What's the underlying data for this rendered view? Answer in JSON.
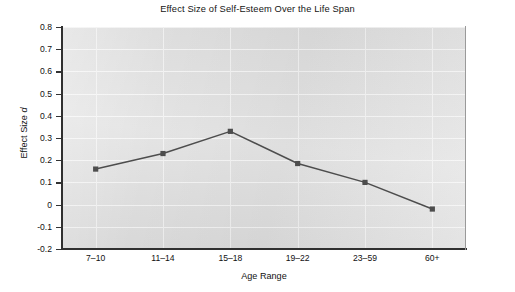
{
  "chart_data": {
    "type": "line",
    "title": "Effect Size of Self-Esteem Over the Life Span",
    "xlabel": "Age Range",
    "ylabel": "Effect Size d",
    "ylabel_plain": "Effect Size ",
    "ylabel_italic": "d",
    "categories": [
      "7–10",
      "11–14",
      "15–18",
      "19–22",
      "23–59",
      "60+"
    ],
    "values": [
      0.16,
      0.23,
      0.33,
      0.185,
      0.1,
      -0.02
    ],
    "series": [
      {
        "name": "Effect Size d",
        "values": [
          0.16,
          0.23,
          0.33,
          0.185,
          0.1,
          -0.02
        ]
      }
    ],
    "ylim": [
      -0.2,
      0.8
    ],
    "ytick_step": 0.1,
    "yticks": [
      0.8,
      0.7,
      0.6,
      0.5,
      0.4,
      0.3,
      0.2,
      0.1,
      0,
      -0.1,
      -0.2
    ],
    "ytick_labels": [
      "0.8",
      "0.7",
      "0.6",
      "0.5",
      "0.4",
      "0.3",
      "0.2",
      "0.1",
      "0",
      "-0.1",
      "-0.2"
    ],
    "grid": "both",
    "gridline_color": "#f4f4f4",
    "legend": "none",
    "marker": "square",
    "marker_color": "#4d4d4d",
    "line_color": "#4d4d4d",
    "plot_background": "#dedede",
    "figure_background": "#ffffff"
  }
}
